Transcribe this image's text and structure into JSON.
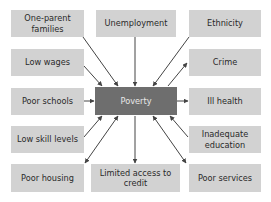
{
  "diagram": {
    "center": {
      "label": "Poverty",
      "color": "#6e6e6e"
    },
    "box_color": "#d2d2d2",
    "arrow_color": "#444444",
    "nodes": [
      {
        "id": "one-parent-families",
        "label": "One-parent families",
        "relation": "cause"
      },
      {
        "id": "unemployment",
        "label": "Unemployment",
        "relation": "cause"
      },
      {
        "id": "ethnicity",
        "label": "Ethnicity",
        "relation": "cause"
      },
      {
        "id": "low-wages",
        "label": "Low wages",
        "relation": "cause"
      },
      {
        "id": "crime",
        "label": "Crime",
        "relation": "effect"
      },
      {
        "id": "poor-schools",
        "label": "Poor schools",
        "relation": "cause"
      },
      {
        "id": "ill-health",
        "label": "Ill health",
        "relation": "effect"
      },
      {
        "id": "low-skill-levels",
        "label": "Low skill levels",
        "relation": "cause"
      },
      {
        "id": "inadequate-education",
        "label": "Inadequate education",
        "relation": "cause"
      },
      {
        "id": "poor-housing",
        "label": "Poor housing",
        "relation": "both"
      },
      {
        "id": "limited-access-to-credit",
        "label": "Limited access to credit",
        "relation": "effect"
      },
      {
        "id": "poor-services",
        "label": "Poor services",
        "relation": "both"
      }
    ]
  }
}
